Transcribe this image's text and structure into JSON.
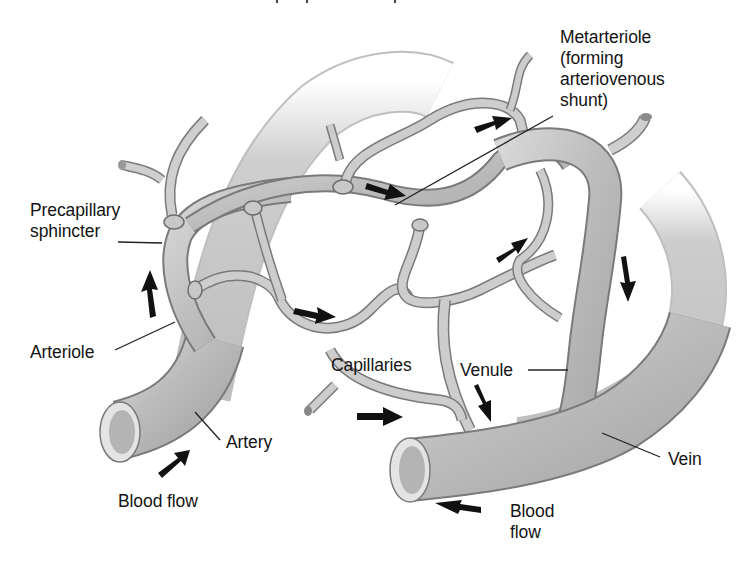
{
  "diagram": {
    "labels": {
      "metarteriole": "Metarteriole\n(forming\narteriovenous\nshunt)",
      "precapillary_sphincter": "Precapillary\nsphincter",
      "arteriole": "Arteriole",
      "artery": "Artery",
      "blood_flow_left": "Blood flow",
      "capillaries": "Capillaries",
      "venule": "Venule",
      "vein": "Vein",
      "blood_flow_right": "Blood\nflow"
    },
    "arrows": [
      {
        "id": "arrow-artery-inflow",
        "direction": "up-right"
      },
      {
        "id": "arrow-arteriole-up",
        "direction": "up"
      },
      {
        "id": "arrow-capillary-loop",
        "direction": "right"
      },
      {
        "id": "arrow-metarteriole",
        "direction": "right"
      },
      {
        "id": "arrow-top-capillary",
        "direction": "right"
      },
      {
        "id": "arrow-right-capillary",
        "direction": "up-right"
      },
      {
        "id": "arrow-venule-down",
        "direction": "down"
      },
      {
        "id": "arrow-lower-capillary",
        "direction": "right"
      },
      {
        "id": "arrow-venule-lower",
        "direction": "down"
      },
      {
        "id": "arrow-vein-outflow",
        "direction": "left"
      }
    ],
    "colors": {
      "vessel_fill": "#bdbdbd",
      "vessel_edge": "#7a7a7a",
      "vessel_highlight": "#dcdcdc",
      "arrow": "#111111",
      "leader_line": "#222222",
      "background": "#ffffff"
    }
  }
}
